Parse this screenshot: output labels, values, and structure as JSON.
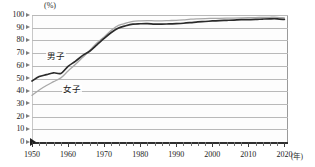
{
  "chart_data": {
    "type": "line",
    "title": "",
    "subtitle": "",
    "xlabel": "年",
    "ylabel": "(%)",
    "unit_caption": "(%)",
    "x_unit_label": "(年)",
    "xlim": [
      1950,
      2021
    ],
    "ylim": [
      0,
      100
    ],
    "y_ticks": [
      0,
      10,
      20,
      30,
      40,
      50,
      60,
      70,
      80,
      90,
      100
    ],
    "x_ticks": [
      1950,
      1960,
      1970,
      1980,
      1990,
      2000,
      2010,
      2020
    ],
    "x_minor_tick_interval": 2,
    "grid": "horizontal",
    "legend_position": "inline-annotation",
    "series": [
      {
        "name": "男子",
        "color": "#2b2b2b",
        "x": [
          1950,
          1952,
          1954,
          1956,
          1958,
          1960,
          1962,
          1964,
          1966,
          1968,
          1970,
          1972,
          1974,
          1976,
          1978,
          1980,
          1982,
          1984,
          1986,
          1988,
          1990,
          1992,
          1994,
          1996,
          1998,
          2000,
          2002,
          2004,
          2006,
          2008,
          2010,
          2012,
          2014,
          2016,
          2018,
          2020
        ],
        "values": [
          48.0,
          51.5,
          53.0,
          54.5,
          54.0,
          59.6,
          63.5,
          68.0,
          71.5,
          76.5,
          81.6,
          86.2,
          89.7,
          91.5,
          92.8,
          93.1,
          93.2,
          92.8,
          92.8,
          93.0,
          93.2,
          93.5,
          94.0,
          94.6,
          94.9,
          95.3,
          95.6,
          95.8,
          96.0,
          96.3,
          96.4,
          96.5,
          96.8,
          97.0,
          97.0,
          96.5
        ]
      },
      {
        "name": "女子",
        "color": "#a8a8a8",
        "x": [
          1950,
          1952,
          1954,
          1956,
          1958,
          1960,
          1962,
          1964,
          1966,
          1968,
          1970,
          1972,
          1974,
          1976,
          1978,
          1980,
          1982,
          1984,
          1986,
          1988,
          1990,
          1992,
          1994,
          1996,
          1998,
          2000,
          2002,
          2004,
          2006,
          2008,
          2010,
          2012,
          2014,
          2016,
          2018,
          2020
        ],
        "values": [
          36.7,
          41.0,
          44.5,
          47.5,
          50.5,
          55.9,
          61.0,
          66.5,
          72.0,
          78.0,
          82.7,
          88.0,
          91.8,
          93.5,
          95.0,
          95.4,
          95.6,
          95.4,
          95.4,
          95.6,
          95.8,
          96.2,
          96.7,
          97.0,
          97.2,
          97.3,
          97.4,
          97.5,
          97.6,
          97.8,
          97.9,
          98.0,
          98.1,
          98.2,
          98.2,
          97.8
        ]
      }
    ],
    "annotations": [
      {
        "text": "男子",
        "x": 1958,
        "y": 65
      },
      {
        "text": "女子",
        "x": 1963,
        "y": 43
      }
    ]
  }
}
